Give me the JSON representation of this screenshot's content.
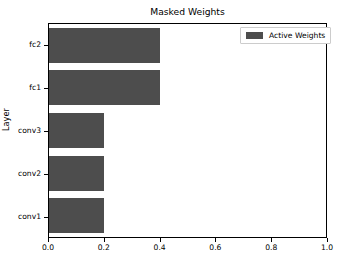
{
  "chart_data": {
    "type": "bar",
    "orientation": "horizontal",
    "title": "Masked Weights",
    "xlabel": "",
    "ylabel": "Layer",
    "categories": [
      "conv1",
      "conv2",
      "conv3",
      "fc1",
      "fc2"
    ],
    "values": [
      0.2,
      0.2,
      0.2,
      0.4,
      0.4
    ],
    "series": [
      {
        "name": "Active Weights",
        "color": "#4d4d4d",
        "values": [
          0.2,
          0.2,
          0.2,
          0.4,
          0.4
        ]
      }
    ],
    "xlim": [
      0.0,
      1.0
    ],
    "xticks": [
      "0.0",
      "0.2",
      "0.4",
      "0.6",
      "0.8",
      "1.0"
    ],
    "xtick_values": [
      0.0,
      0.2,
      0.4,
      0.6,
      0.8,
      1.0
    ],
    "yticks": [
      "fc2",
      "fc1",
      "conv3",
      "conv2",
      "conv1"
    ],
    "grid": false,
    "legend": {
      "position": "upper right",
      "entries": [
        {
          "label": "Active Weights",
          "color": "#4d4d4d"
        }
      ]
    },
    "background_color": "#ffffff",
    "axes_edge_color": "#000000"
  }
}
